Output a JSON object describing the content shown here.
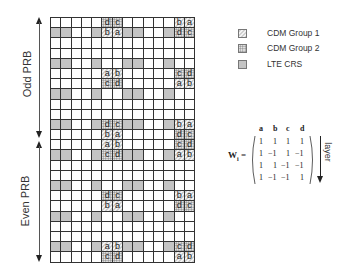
{
  "labels": {
    "odd_prb": "Odd PRB",
    "even_prb": "Even PRB"
  },
  "legend": [
    {
      "label": "CDM Group 1",
      "pattern": "diagonal-hatch"
    },
    {
      "label": "CDM Group 2",
      "pattern": "dots"
    },
    {
      "label": "LTE CRS",
      "pattern": "gray-fill",
      "color": "#c4c4c4"
    }
  ],
  "grid": {
    "columns": 14,
    "rows": 24,
    "crs_columns": [
      0,
      1,
      4,
      7,
      8,
      11
    ],
    "crs_rows": [
      1,
      4,
      7,
      10,
      13,
      16,
      19,
      22
    ],
    "dmrs_columns_group1": [
      5,
      6
    ],
    "dmrs_columns_group2": [
      12,
      13
    ],
    "dmrs_rows": {
      "0": [
        "d",
        "c",
        "b",
        "a"
      ],
      "1": [
        "b",
        "a",
        "d",
        "c"
      ],
      "5": [
        "a",
        "b",
        "c",
        "d"
      ],
      "6": [
        "c",
        "d",
        "a",
        "b"
      ],
      "10": [
        "d",
        "c",
        "b",
        "a"
      ],
      "11": [
        "b",
        "a",
        "d",
        "c"
      ],
      "12": [
        "a",
        "b",
        "c",
        "d"
      ],
      "13": [
        "c",
        "d",
        "a",
        "b"
      ],
      "17": [
        "d",
        "c",
        "b",
        "a"
      ],
      "18": [
        "b",
        "a",
        "d",
        "c"
      ],
      "22": [
        "a",
        "b",
        "c",
        "d"
      ],
      "23": [
        "c",
        "d",
        "a",
        "b"
      ]
    }
  },
  "matrix": {
    "symbol": "W",
    "subscript": "i",
    "equals": "=",
    "column_headers": [
      "a",
      "b",
      "c",
      "d"
    ],
    "rows": [
      [
        "1",
        "1",
        "1",
        "1"
      ],
      [
        "1",
        "−1",
        "1",
        "−1"
      ],
      [
        "1",
        "1",
        "−1",
        "−1"
      ],
      [
        "1",
        "−1",
        "−1",
        "1"
      ]
    ],
    "axis_label": "layer"
  }
}
